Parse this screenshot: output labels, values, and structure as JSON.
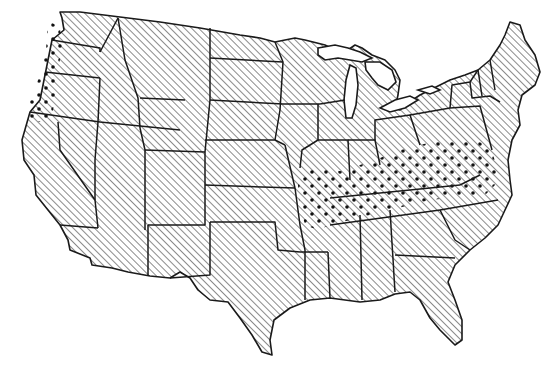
{
  "map": {
    "title": "United States distribution map",
    "region": "Contiguous United States",
    "legend_visible": false,
    "patterns": {
      "base": "diagonal-hatch",
      "highlight": "diagonal-hatch-with-dots"
    },
    "colors": {
      "outline": "#1a1a1a",
      "hatch": "#2a2a2a",
      "background": "#ffffff",
      "dots": "#111111"
    },
    "highlighted_areas": [
      "Western Washington",
      "Western Oregon",
      "Missouri (southern)",
      "Kentucky",
      "Tennessee (northern)",
      "West Virginia",
      "Virginia",
      "Southern Indiana",
      "Southern Ohio",
      "Southern Illinois"
    ]
  }
}
